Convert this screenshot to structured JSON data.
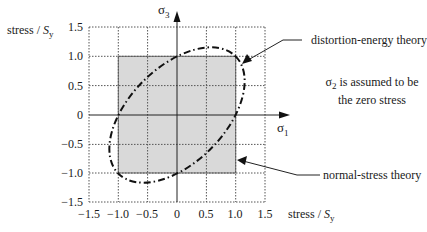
{
  "diagram": {
    "y_axis_label_prefix": "stress / ",
    "y_axis_label_var": "S",
    "y_axis_label_sub": "y",
    "x_axis_label_prefix": "stress / ",
    "x_axis_label_var": "S",
    "x_axis_label_sub": "y",
    "vertical_axis_symbol": "σ",
    "vertical_axis_sub": "3",
    "horizontal_axis_symbol": "σ",
    "horizontal_axis_sub": "1",
    "y_ticks": [
      "1.5",
      "1.0",
      "0.5",
      "0",
      "−0.5",
      "−1.0",
      "−1.5"
    ],
    "x_ticks": [
      "−1.5",
      "−1.0",
      "−0.5",
      "0",
      "0.5",
      "1.0",
      "1.5"
    ],
    "annotations": {
      "distortion": "distortion-energy theory",
      "normal": "normal-stress theory",
      "note_line1_sym": "σ",
      "note_line1_sub": "2",
      "note_line1_rest": " is assumed to be",
      "note_line2": "the zero stress"
    },
    "colors": {
      "box_fill": "#d9d9d9",
      "axis": "#222222",
      "grid": "#555555"
    },
    "normal_stress_box": {
      "x": [
        -1.0,
        1.0
      ],
      "y": [
        -1.0,
        1.0
      ]
    },
    "distortion_energy_ellipse": "σ1² − σ1·σ3 + σ3² = 1"
  }
}
